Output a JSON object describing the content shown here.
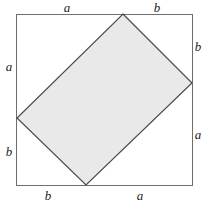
{
  "figure": {
    "type": "geometry-diagram",
    "width": 208,
    "height": 204,
    "background_color": "#ffffff"
  },
  "colors": {
    "square_stroke": "#6e6e6e",
    "rect_stroke": "#4a4a4a",
    "rect_fill": "#e9e9e9",
    "label_color": "#1c1c1c"
  },
  "outer_square": {
    "name": "outer-square",
    "left": 16,
    "top": 14,
    "right": 192,
    "bottom": 185,
    "side_px": 176,
    "stroke_width": 1
  },
  "inner_rectangle": {
    "name": "inscribed-rectangle",
    "stroke_width": 1.2,
    "vertices": [
      {
        "name": "top-vertex",
        "x": 123,
        "y": 14
      },
      {
        "name": "right-vertex",
        "x": 192,
        "y": 83
      },
      {
        "name": "bottom-vertex",
        "x": 86,
        "y": 185
      },
      {
        "name": "left-vertex",
        "x": 17,
        "y": 118
      }
    ],
    "points_attr": "123,14 192,83 86,185 17,118"
  },
  "labels": [
    {
      "id": "top-left",
      "text": "a",
      "x": 67,
      "y": 1,
      "side": "top",
      "segment": "left"
    },
    {
      "id": "top-right",
      "text": "b",
      "x": 157,
      "y": 1,
      "side": "top",
      "segment": "right"
    },
    {
      "id": "right-top",
      "text": "b",
      "x": 197,
      "y": 40,
      "side": "right",
      "segment": "top"
    },
    {
      "id": "right-bottom",
      "text": "a",
      "x": 197,
      "y": 128,
      "side": "right",
      "segment": "bottom"
    },
    {
      "id": "bottom-left",
      "text": "b",
      "x": 48,
      "y": 189,
      "side": "bottom",
      "segment": "left"
    },
    {
      "id": "bottom-right",
      "text": "a",
      "x": 140,
      "y": 189,
      "side": "bottom",
      "segment": "right"
    },
    {
      "id": "left-top",
      "text": "a",
      "x": 6,
      "y": 60,
      "side": "left",
      "segment": "top"
    },
    {
      "id": "left-bottom",
      "text": "b",
      "x": 6,
      "y": 145,
      "side": "left",
      "segment": "bottom"
    }
  ]
}
